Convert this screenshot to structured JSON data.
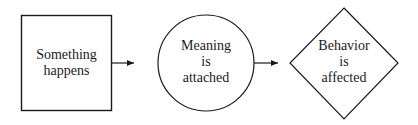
{
  "diagram": {
    "type": "flow",
    "nodes": [
      {
        "id": "event",
        "shape": "square",
        "lines": [
          "Something",
          "happens"
        ]
      },
      {
        "id": "meaning",
        "shape": "circle",
        "lines": [
          "Meaning",
          "is",
          "attached"
        ]
      },
      {
        "id": "behavior",
        "shape": "diamond",
        "lines": [
          "Behavior",
          "is",
          "affected"
        ]
      }
    ],
    "edges": [
      {
        "from": "event",
        "to": "meaning"
      },
      {
        "from": "meaning",
        "to": "behavior"
      }
    ],
    "colors": {
      "stroke": "#1a1a1a",
      "background": "#ffffff"
    }
  }
}
